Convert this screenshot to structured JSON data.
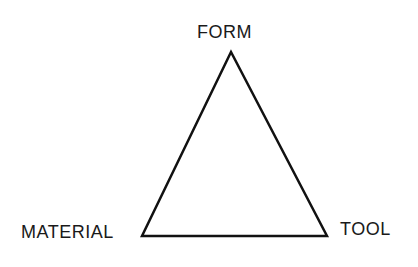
{
  "diagram": {
    "type": "triangle",
    "nodes": [
      {
        "id": "form",
        "label": "FORM",
        "position": "top"
      },
      {
        "id": "material",
        "label": "MATERIAL",
        "position": "bottom-left"
      },
      {
        "id": "tool",
        "label": "TOOL",
        "position": "bottom-right"
      }
    ],
    "edges": [
      {
        "from": "form",
        "to": "material"
      },
      {
        "from": "material",
        "to": "tool"
      },
      {
        "from": "tool",
        "to": "form"
      }
    ],
    "line_color": "#111111"
  }
}
